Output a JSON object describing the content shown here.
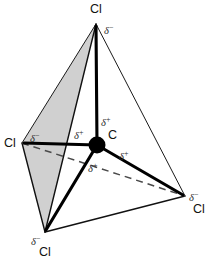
{
  "diagram": {
    "central_atom": {
      "symbol": "C",
      "x": 97,
      "y": 145
    },
    "colors": {
      "shaded_face": "#d0d0d0",
      "line": "#111111",
      "dashed": "#4a4a4a",
      "background": "#ffffff"
    },
    "vertices": [
      {
        "id": "top",
        "label": "Cl",
        "label_x": 96,
        "label_y": 13,
        "x": 96,
        "y": 24
      },
      {
        "id": "left",
        "label": "Cl",
        "label_x": 10,
        "label_y": 147,
        "x": 22,
        "y": 143
      },
      {
        "id": "bottom-left",
        "label": "Cl",
        "label_x": 45,
        "label_y": 256,
        "x": 45,
        "y": 232
      },
      {
        "id": "right",
        "label": "Cl",
        "label_x": 198,
        "label_y": 213,
        "x": 185,
        "y": 196
      }
    ],
    "charges": [
      {
        "id": "delta-minus-top",
        "symbol": "δ",
        "sign": "−",
        "x": 104,
        "y": 30
      },
      {
        "id": "delta-minus-left",
        "symbol": "δ",
        "sign": "−",
        "x": 30,
        "y": 139
      },
      {
        "id": "delta-minus-bottom-left",
        "symbol": "δ",
        "sign": "−",
        "x": 31,
        "y": 243
      },
      {
        "id": "delta-minus-right",
        "symbol": "δ",
        "sign": "−",
        "x": 190,
        "y": 198
      },
      {
        "id": "delta-plus-up",
        "symbol": "δ",
        "sign": "+",
        "x": 101,
        "y": 122
      },
      {
        "id": "delta-plus-left",
        "symbol": "δ",
        "sign": "+",
        "x": 76,
        "y": 138
      },
      {
        "id": "delta-plus-right",
        "symbol": "δ",
        "sign": "+",
        "x": 120,
        "y": 157
      },
      {
        "id": "delta-plus-down",
        "symbol": "δ",
        "sign": "+",
        "x": 90,
        "y": 169
      }
    ],
    "legend": {
      "delta_minus": "δ−",
      "delta_plus": "δ+",
      "chlorine": "Cl",
      "carbon": "C"
    }
  }
}
